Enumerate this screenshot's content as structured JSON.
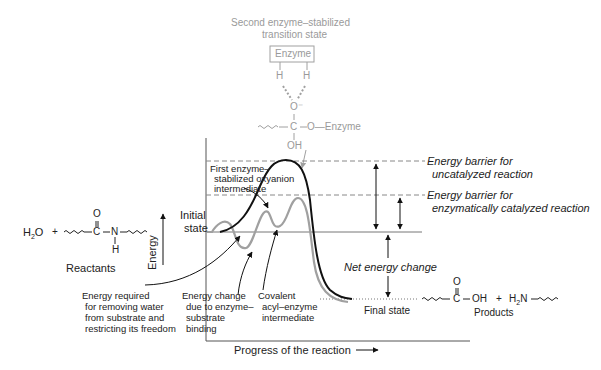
{
  "transition_state": {
    "title_line1": "Second enzyme–stabilized",
    "title_line2": "transition state",
    "enzyme_box": "Enzyme",
    "h_left": "H",
    "h_right": "H",
    "oxygen_minus": "O⁻",
    "carbon": "C",
    "ester_o_enzyme": "O—Enzyme",
    "hydroxyl": "OH"
  },
  "reactants": {
    "water": "H₂O",
    "plus": "+",
    "carbonyl_o": "O",
    "carbon": "C",
    "nitrogen": "N",
    "amide_h": "H",
    "label": "Reactants"
  },
  "products": {
    "carbonyl_o": "O",
    "carbon": "C",
    "hydroxyl": "OH",
    "plus": "+",
    "amine": "H₂N",
    "label": "Products"
  },
  "axes": {
    "y_label": "Energy",
    "x_label": "Progress of the reaction"
  },
  "labels": {
    "initial_state_1": "Initial",
    "initial_state_2": "state",
    "final_state": "Final state",
    "first_intermediate_1": "First enzyme–",
    "first_intermediate_2": "stabilized oxyanion",
    "first_intermediate_3": "intermediate",
    "barrier_uncat_1": "Energy barrier for",
    "barrier_uncat_2": "uncatalyzed reaction",
    "barrier_cat_1": "Energy barrier for",
    "barrier_cat_2": "enzymatically catalyzed reaction",
    "net_energy": "Net energy change",
    "water_removal_1": "Energy required",
    "water_removal_2": "for removing water",
    "water_removal_3": "from substrate and",
    "water_removal_4": "restricting its freedom",
    "binding_1": "Energy change",
    "binding_2": "due to enzyme–",
    "binding_3": "substrate",
    "binding_4": "binding",
    "acyl_1": "Covalent",
    "acyl_2": "acyl–enzyme",
    "acyl_3": "intermediate"
  },
  "colors": {
    "uncatalyzed_curve": "#111111",
    "catalyzed_curve": "#a0a0a0",
    "transition_state_text": "#9a9a9a",
    "dashed_lines": "#888888"
  }
}
